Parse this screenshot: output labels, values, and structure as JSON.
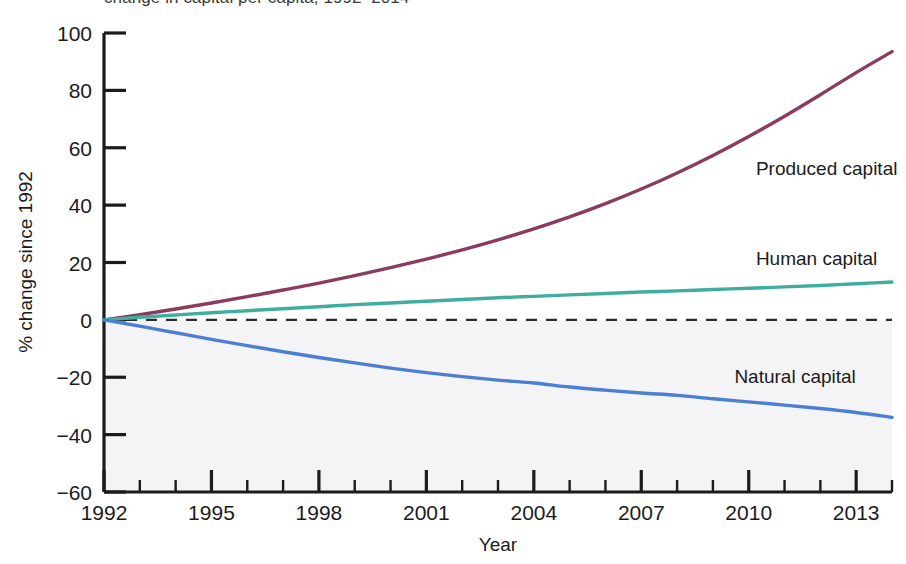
{
  "figure": {
    "clipped_top_text": "change in capital per capita, 1992–2014",
    "background_color": "#ffffff",
    "below_zero_band_color": "#f4f3f6"
  },
  "chart_data": {
    "type": "line",
    "title": "",
    "xlabel": "Year",
    "ylabel": "% change since 1992",
    "xlim": [
      1992,
      2014
    ],
    "ylim": [
      -60,
      100
    ],
    "grid": false,
    "legend_position": "inline-right-of-curves",
    "xticks": [
      1992,
      1995,
      1998,
      2001,
      2004,
      2007,
      2010,
      2013
    ],
    "xtick_labels": [
      "1992",
      "1995",
      "1998",
      "2001",
      "2004",
      "2007",
      "2010",
      "2013"
    ],
    "xminor_step": 1,
    "yticks": [
      -60,
      -40,
      -20,
      0,
      20,
      40,
      60,
      80,
      100
    ],
    "ytick_labels": [
      "−60",
      "−40",
      "−20",
      "0",
      "20",
      "40",
      "60",
      "80",
      "100"
    ],
    "zero_reference_line": {
      "value": 0,
      "style": "dashed",
      "color": "#2b2b2b"
    },
    "x": [
      1992,
      1993,
      1994,
      1995,
      1996,
      1997,
      1998,
      1999,
      2000,
      2001,
      2002,
      2003,
      2004,
      2005,
      2006,
      2007,
      2008,
      2009,
      2010,
      2011,
      2012,
      2013,
      2014
    ],
    "series": [
      {
        "name": "Produced capital",
        "color": "#8a3b5f",
        "label": "Produced capital",
        "label_x": 2010.2,
        "label_y": 53.0,
        "values": [
          0.0,
          1.8,
          3.8,
          5.9,
          8.1,
          10.4,
          12.8,
          15.4,
          18.2,
          21.2,
          24.4,
          27.9,
          31.7,
          35.9,
          40.5,
          45.6,
          51.2,
          57.3,
          63.9,
          71.0,
          78.5,
          86.2,
          93.5
        ]
      },
      {
        "name": "Human capital",
        "color": "#3fae9e",
        "label": "Human capital",
        "label_x": 2010.2,
        "label_y": 21.5,
        "values": [
          0.0,
          0.9,
          1.7,
          2.5,
          3.2,
          3.9,
          4.6,
          5.3,
          5.9,
          6.5,
          7.1,
          7.7,
          8.2,
          8.7,
          9.2,
          9.7,
          10.1,
          10.6,
          11.0,
          11.5,
          12.0,
          12.6,
          13.2
        ]
      },
      {
        "name": "Natural capital",
        "color": "#4a7fd4",
        "label": "Natural capital",
        "label_x": 2009.6,
        "label_y": -19.5,
        "values": [
          0.0,
          -2.2,
          -4.5,
          -6.8,
          -9.0,
          -11.1,
          -13.1,
          -15.0,
          -16.8,
          -18.4,
          -19.8,
          -21.0,
          -22.0,
          -23.4,
          -24.5,
          -25.5,
          -26.3,
          -27.5,
          -28.6,
          -29.7,
          -30.9,
          -32.3,
          -34.0
        ]
      }
    ]
  }
}
